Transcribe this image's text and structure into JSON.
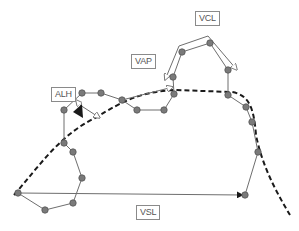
{
  "labels": {
    "vcl": "VCL",
    "vap": "VAP",
    "alh": "ALH",
    "vsl": "VSL"
  },
  "colors": {
    "node_fill": "#7a7a7a",
    "node_stroke": "#555555",
    "path_line": "#6e6e6e",
    "average_path": "#1a1a1a",
    "label_border": "#8a8a8a",
    "label_text": "#555555"
  },
  "curvilinear_path_nodes": [
    [
      18,
      193
    ],
    [
      45,
      210
    ],
    [
      73,
      203
    ],
    [
      82,
      178
    ],
    [
      73,
      152
    ],
    [
      64,
      143
    ],
    [
      64,
      110
    ],
    [
      82,
      93
    ],
    [
      101,
      93
    ],
    [
      122,
      100
    ],
    [
      137,
      110
    ],
    [
      164,
      110
    ],
    [
      174,
      94
    ],
    [
      173,
      77
    ],
    [
      182,
      52
    ],
    [
      210,
      43
    ],
    [
      228,
      70
    ],
    [
      228,
      95
    ],
    [
      246,
      107
    ],
    [
      252,
      122
    ],
    [
      258,
      152
    ],
    [
      245,
      195
    ]
  ]
}
